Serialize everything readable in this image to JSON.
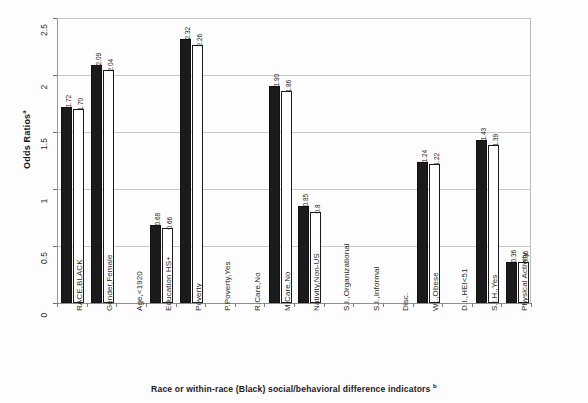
{
  "chart_data": {
    "type": "bar",
    "title": "",
    "xlabel": "Race or within-race (Black) social/behavioral difference indicators",
    "xlabel_superscript": "b",
    "ylabel": "Odds Ratios",
    "ylabel_superscript": "a",
    "ylim": [
      0,
      2.5
    ],
    "yticks": [
      0,
      0.5,
      1,
      1.5,
      2,
      2.5
    ],
    "ytick_labels": [
      "0",
      "0.5",
      "1",
      "1.5",
      "2",
      "2.5"
    ],
    "grid": true,
    "grid_axis": "y",
    "legend": "none",
    "orientation": "vertical",
    "categories": [
      "RACE,BLACK",
      "Gender,Female",
      "Age,<1920",
      "Education HS+",
      "Poverty",
      "P.Poverty,Yes",
      "R.Care,No",
      "M.Care,No",
      "Nativity,Non-US",
      "S.I.,Organizational",
      "S.I.,Informal",
      "Disc.",
      "Wt.,Obese",
      "D.I.,HEI<51",
      "S.I.H.,Yes",
      "Physical Activity"
    ],
    "series": [
      {
        "name": "Model 1 (filled)",
        "style": "filled-black",
        "values": [
          1.72,
          2.09,
          null,
          0.68,
          2.32,
          null,
          null,
          1.9,
          0.85,
          null,
          null,
          null,
          1.24,
          null,
          1.43,
          0.36
        ],
        "value_labels": [
          "1.72",
          "2.09",
          "",
          "0.68",
          "2.32",
          "",
          "",
          "1.90",
          "0.85",
          "",
          "",
          "",
          "1.24",
          "",
          "1.43",
          "0.36"
        ]
      },
      {
        "name": "Model 2 (open)",
        "style": "open-white",
        "values": [
          1.7,
          2.04,
          null,
          0.66,
          2.26,
          null,
          null,
          1.86,
          0.8,
          null,
          null,
          null,
          1.22,
          null,
          1.39,
          0.36
        ],
        "value_labels": [
          "1.70",
          "2.04",
          "",
          "0.66",
          "2.26",
          "",
          "",
          "1.86",
          "0.8",
          "",
          "",
          "",
          "1.22",
          "",
          "1.39",
          "0.36"
        ]
      }
    ],
    "colors": {
      "filled_bar": "#1b1b1b",
      "open_bar": "#ffffff",
      "bar_outline": "#1b1b1b",
      "gridline": "#c9c9c9",
      "axis": "#8f8f8f",
      "text": "#1a1a1a",
      "background": "#fdfdfd"
    }
  }
}
